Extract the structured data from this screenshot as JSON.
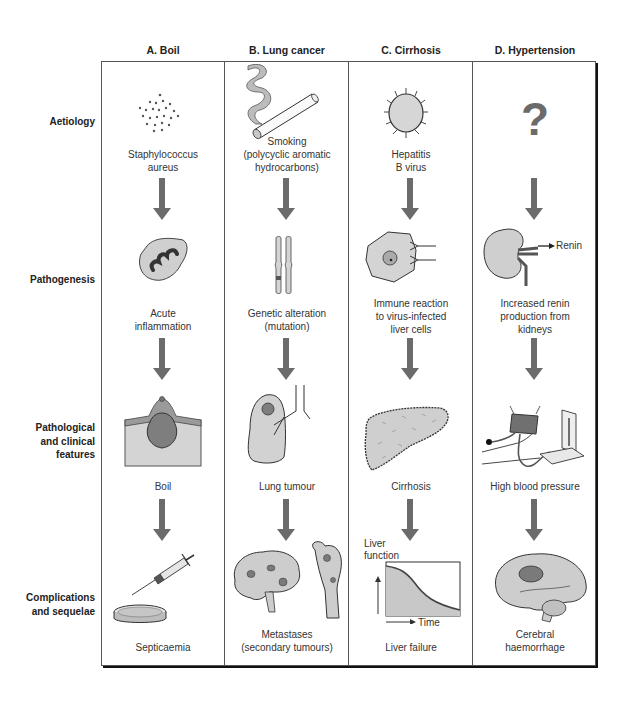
{
  "columns": [
    {
      "id": "A",
      "title": "A. Boil"
    },
    {
      "id": "B",
      "title": "B. Lung cancer"
    },
    {
      "id": "C",
      "title": "C. Cirrhosis"
    },
    {
      "id": "D",
      "title": "D. Hypertension"
    }
  ],
  "rows": [
    {
      "id": "aetiology",
      "label": "Aetiology"
    },
    {
      "id": "pathogenesis",
      "label": "Pathogenesis"
    },
    {
      "id": "features",
      "label_lines": [
        "Pathological",
        "and clinical",
        "features"
      ]
    },
    {
      "id": "complications",
      "label_lines": [
        "Complications",
        "and sequelae"
      ]
    }
  ],
  "cells": {
    "A": {
      "aetiology": {
        "lines": [
          "Staphylococcus",
          "aureus"
        ],
        "icon": "bacteria-cluster-icon"
      },
      "pathogenesis": {
        "lines": [
          "Acute",
          "inflammation"
        ],
        "icon": "inflamed-cell-icon"
      },
      "features": {
        "lines": [
          "Boil"
        ],
        "icon": "skin-boil-icon"
      },
      "complications": {
        "lines": [
          "Septicaemia"
        ],
        "icon": "syringe-petri-dish-icon"
      }
    },
    "B": {
      "aetiology": {
        "lines": [
          "Smoking",
          "(polycyclic aromatic",
          "hydrocarbons)"
        ],
        "icon": "cigarette-icon"
      },
      "pathogenesis": {
        "lines": [
          "Genetic alteration",
          "(mutation)"
        ],
        "icon": "chromosome-icon"
      },
      "features": {
        "lines": [
          "Lung tumour"
        ],
        "icon": "lung-tumour-icon"
      },
      "complications": {
        "lines": [
          "Metastases",
          "(secondary tumours)"
        ],
        "icon": "brain-bone-metastases-icon"
      }
    },
    "C": {
      "aetiology": {
        "lines": [
          "Hepatitis",
          "B virus"
        ],
        "icon": "virus-icon"
      },
      "pathogenesis": {
        "lines": [
          "Immune reaction",
          "to virus-infected",
          "liver cells"
        ],
        "icon": "liver-cell-antibody-icon"
      },
      "features": {
        "lines": [
          "Cirrhosis"
        ],
        "icon": "cirrhotic-liver-icon"
      },
      "complications": {
        "lines": [
          "Liver failure"
        ],
        "icon": "liver-function-graph-icon",
        "graph": {
          "ylabel_lines": [
            "Liver",
            "function"
          ],
          "xlabel": "Time"
        }
      }
    },
    "D": {
      "aetiology": {
        "lines": [],
        "icon": "question-mark-icon",
        "symbol": "?"
      },
      "pathogenesis": {
        "lines": [
          "Increased renin",
          "production from",
          "kidneys"
        ],
        "icon": "kidney-icon",
        "annotation": "Renin"
      },
      "features": {
        "lines": [
          "High blood pressure"
        ],
        "icon": "sphygmomanometer-icon"
      },
      "complications": {
        "lines": [
          "Cerebral",
          "haemorrhage"
        ],
        "icon": "brain-haemorrhage-icon"
      }
    }
  },
  "colors": {
    "arrow": "#6b6b6b",
    "fill_light": "#c8c8c8",
    "fill_dark": "#7a7a7a",
    "border": "#555555"
  }
}
